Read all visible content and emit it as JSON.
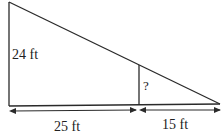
{
  "diagram": {
    "type": "similar-triangles",
    "labels": {
      "left_height": "24 ft",
      "unknown_height": "?",
      "left_base": "25 ft",
      "right_base": "15 ft"
    },
    "colors": {
      "line": "#2a2a2a",
      "background": "#ffffff"
    }
  }
}
